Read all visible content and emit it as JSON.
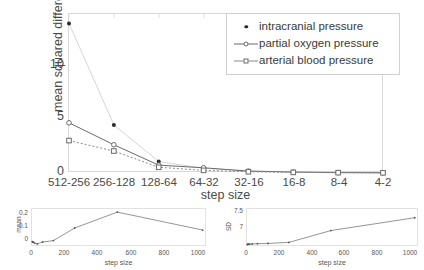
{
  "chart_data": [
    {
      "type": "line",
      "title": "",
      "xlabel": "step size",
      "ylabel": "mean squared difference",
      "categories": [
        "512-256",
        "256-128",
        "128-64",
        "64-32",
        "32-16",
        "16-8",
        "8-4",
        "4-2"
      ],
      "ylim": [
        0,
        15.2
      ],
      "yticks": [
        0,
        5,
        10
      ],
      "ytick_labels": [
        "0",
        "5",
        "10"
      ],
      "grid": false,
      "legend_position": "top-right",
      "series": [
        {
          "name": "intracranial pressure",
          "marker": "dot",
          "color": "#2b2b2b",
          "line_color": "#d6d6d6",
          "values": [
            14.3,
            4.6,
            1.1,
            0.45,
            0.2,
            0.1,
            0.05,
            0.02
          ]
        },
        {
          "name": "partial oxygen pressure",
          "marker": "circle",
          "color": "#6a6a6a",
          "line_color": "#6a6a6a",
          "values": [
            4.8,
            2.7,
            0.75,
            0.5,
            0.18,
            0.09,
            0.04,
            0.02
          ]
        },
        {
          "name": "arterial blood pressure",
          "marker": "square",
          "color": "#6a6a6a",
          "line_color": "#8a8a8a",
          "values": [
            3.1,
            2.1,
            0.55,
            0.25,
            0.12,
            0.06,
            0.03,
            0.02
          ]
        }
      ]
    },
    {
      "type": "line",
      "title": "",
      "xlabel": "step size",
      "ylabel": "mean",
      "xlim": [
        0,
        1050
      ],
      "ylim": [
        -0.035,
        0.245
      ],
      "xticks": [
        0,
        200,
        400,
        600,
        800,
        1000
      ],
      "xtick_labels": [
        "0",
        "200",
        "400",
        "600",
        "800",
        "1000"
      ],
      "yticks": [
        0,
        0.1,
        0.2
      ],
      "ytick_labels": [
        "0",
        "0.1",
        "0.2"
      ],
      "x": [
        2,
        4,
        8,
        16,
        32,
        64,
        128,
        256,
        512,
        1024
      ],
      "values": [
        0.005,
        0.002,
        0.0,
        -0.006,
        -0.012,
        0.002,
        0.012,
        0.105,
        0.222,
        0.09
      ]
    },
    {
      "type": "line",
      "title": "",
      "xlabel": "step size",
      "ylabel": "SD",
      "xlim": [
        0,
        1050
      ],
      "ylim": [
        6.88,
        7.62
      ],
      "xticks": [
        0,
        200,
        400,
        600,
        800,
        1000
      ],
      "xtick_labels": [
        "0",
        "200",
        "400",
        "600",
        "800",
        "1000"
      ],
      "yticks": [
        7,
        7.5
      ],
      "ytick_labels": [
        "7",
        "7.5"
      ],
      "x": [
        2,
        4,
        8,
        16,
        32,
        64,
        128,
        256,
        512,
        1024
      ],
      "values": [
        6.93,
        6.93,
        6.935,
        6.935,
        6.94,
        6.945,
        6.95,
        6.97,
        7.2,
        7.45
      ]
    }
  ],
  "main": {
    "ylabel": "mean squared difference",
    "xlabel": "step size",
    "yticks": [
      "0",
      "5",
      "10"
    ],
    "xticks": [
      "512-256",
      "256-128",
      "128-64",
      "64-32",
      "32-16",
      "16-8",
      "8-4",
      "4-2"
    ]
  },
  "legend": {
    "items": [
      {
        "label": "intracranial pressure",
        "marker": "dot"
      },
      {
        "label": "partial oxygen pressure",
        "marker": "circle"
      },
      {
        "label": "arterial blood pressure",
        "marker": "square"
      }
    ]
  },
  "subplot_mean": {
    "ylabel": "mean",
    "xlabel": "step size",
    "yticks": [
      "0.2",
      "0.1",
      "0"
    ],
    "xticks": [
      "0",
      "200",
      "400",
      "600",
      "800",
      "1000"
    ]
  },
  "subplot_sd": {
    "ylabel": "SD",
    "xlabel": "step size",
    "yticks": [
      "7.5",
      "7"
    ],
    "xticks": [
      "0",
      "200",
      "400",
      "600",
      "800",
      "1000"
    ]
  }
}
